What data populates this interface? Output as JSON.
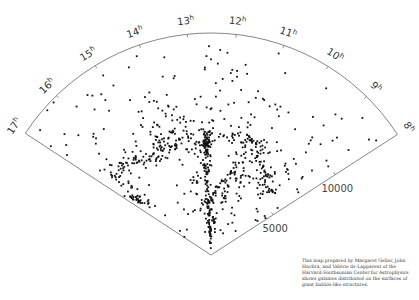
{
  "chart_data": {
    "type": "scatter",
    "title": "",
    "projection": "polar-wedge",
    "ra_axis": {
      "labels": [
        "8h",
        "9h",
        "10h",
        "11h",
        "12h",
        "13h",
        "14h",
        "15h",
        "16h",
        "17h"
      ],
      "range_hours": [
        8,
        17
      ]
    },
    "velocity_axis": {
      "ticks": [
        5000,
        10000
      ],
      "tick_labels": [
        "5000",
        "10000"
      ],
      "range": [
        0,
        15000
      ]
    },
    "clusters": [
      {
        "ra": 12.7,
        "v": 7500,
        "n": 70,
        "sra": 0.12,
        "sv": 500,
        "name": "coma-core"
      },
      {
        "ra": 12.75,
        "v": 5200,
        "n": 40,
        "sra": 0.1,
        "sv": 900
      },
      {
        "ra": 12.8,
        "v": 3200,
        "n": 28,
        "sra": 0.1,
        "sv": 700
      },
      {
        "ra": 12.7,
        "v": 1500,
        "n": 22,
        "sra": 0.15,
        "sv": 500
      },
      {
        "ra": 11.5,
        "v": 4200,
        "n": 16,
        "sra": 0.12,
        "sv": 500
      },
      {
        "ra": 11.3,
        "v": 6500,
        "n": 14,
        "sra": 0.15,
        "sv": 600
      },
      {
        "ra": 11.0,
        "v": 8000,
        "n": 34,
        "sra": 0.4,
        "sv": 700
      },
      {
        "ra": 10.3,
        "v": 7000,
        "n": 22,
        "sra": 0.3,
        "sv": 900
      },
      {
        "ra": 9.6,
        "v": 6200,
        "n": 16,
        "sra": 0.25,
        "sv": 700
      },
      {
        "ra": 9.2,
        "v": 7800,
        "n": 10,
        "sra": 0.2,
        "sv": 500
      },
      {
        "ra": 13.6,
        "v": 8500,
        "n": 40,
        "sra": 0.35,
        "sv": 900
      },
      {
        "ra": 14.2,
        "v": 9500,
        "n": 26,
        "sra": 0.4,
        "sv": 1100
      },
      {
        "ra": 14.6,
        "v": 7800,
        "n": 30,
        "sra": 0.5,
        "sv": 600
      },
      {
        "ra": 15.6,
        "v": 8200,
        "n": 26,
        "sra": 0.35,
        "sv": 500
      },
      {
        "ra": 16.4,
        "v": 8600,
        "n": 20,
        "sra": 0.25,
        "sv": 600
      },
      {
        "ra": 16.7,
        "v": 6400,
        "n": 18,
        "sra": 0.12,
        "sv": 400
      },
      {
        "ra": 13.5,
        "v": 5500,
        "n": 14,
        "sra": 0.3,
        "sv": 900
      },
      {
        "ra": 13.3,
        "v": 3000,
        "n": 10,
        "sra": 0.3,
        "sv": 700
      },
      {
        "ra": 12.0,
        "v": 2500,
        "n": 16,
        "sra": 0.35,
        "sv": 700
      },
      {
        "ra": 10.8,
        "v": 5300,
        "n": 14,
        "sra": 0.35,
        "sv": 800
      },
      {
        "ra": 12.2,
        "v": 9000,
        "n": 20,
        "sra": 0.4,
        "sv": 900
      },
      {
        "ra": 13.0,
        "v": 11500,
        "n": 10,
        "sra": 0.5,
        "sv": 1000
      },
      {
        "ra": 11.2,
        "v": 11000,
        "n": 14,
        "sra": 0.6,
        "sv": 1500
      },
      {
        "ra": 10.0,
        "v": 10500,
        "n": 10,
        "sra": 0.5,
        "sv": 1500
      },
      {
        "ra": 8.6,
        "v": 10500,
        "n": 8,
        "sra": 0.3,
        "sv": 2000
      },
      {
        "ra": 15.0,
        "v": 11500,
        "n": 10,
        "sra": 0.6,
        "sv": 1500
      },
      {
        "ra": 16.3,
        "v": 12000,
        "n": 8,
        "sra": 0.4,
        "sv": 1500
      },
      {
        "ra": 12.5,
        "v": 13500,
        "n": 8,
        "sra": 0.8,
        "sv": 800
      }
    ],
    "point_color": "#111111"
  },
  "caption": {
    "text": "This map prepared by Margaret Geller, John Huchra, and Valérie de Lapparent of the Harvard-Smithsonian Center for Astrophysics shows galaxies distributed on the surfaces of giant bubble-like structures."
  },
  "geometry": {
    "apex": [
      211,
      255
    ],
    "radius_px": 222,
    "vmax": 15000,
    "frame_color": "#777777"
  }
}
